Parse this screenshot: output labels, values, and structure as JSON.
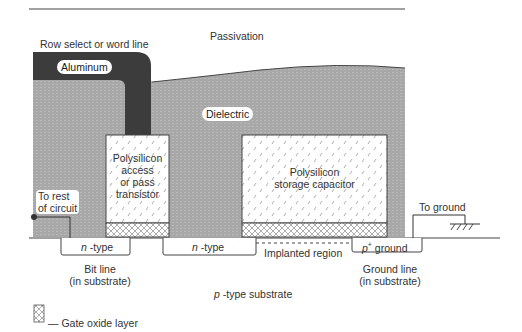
{
  "diagram": {
    "labels": {
      "passivation": "Passivation",
      "word_line": "Row select or word line",
      "aluminum": "Aluminum",
      "dielectric": "Dielectric",
      "access_transistor": [
        "Polysilicon",
        "access",
        "or pass",
        "transistor"
      ],
      "storage_capacitor": [
        "Polysilicon",
        "storage capacitor"
      ],
      "to_rest_of_circuit": [
        "To rest",
        "of circuit"
      ],
      "to_ground": "To ground",
      "n_type_1": "-type",
      "n_type_2": "-type",
      "n_italic": "n",
      "p_italic": "p",
      "p_plus_ground": "ground",
      "plus": "+",
      "implanted_region": "Implanted region",
      "bit_line": [
        "Bit line",
        "(in substrate)"
      ],
      "ground_line": [
        "Ground line",
        "(in substrate)"
      ],
      "substrate": "-type substrate",
      "legend_gate_oxide": "— Gate oxide layer"
    },
    "colors": {
      "aluminum": "#3a3a3a",
      "dielectric": "#a9a9a9",
      "polysilicon": "#ffffff",
      "line": "#333333"
    }
  }
}
